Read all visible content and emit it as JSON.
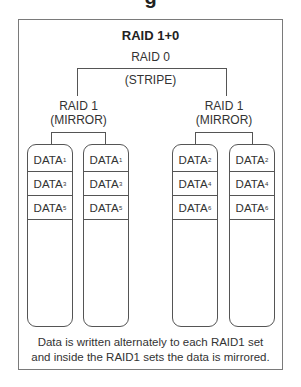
{
  "header": {
    "cut_off_title": "g"
  },
  "diagram": {
    "title": "RAID 1+0",
    "stripe": {
      "label": "RAID 0",
      "sublabel": "(STRIPE)"
    },
    "mirrors": [
      {
        "label": "RAID 1",
        "sublabel": "(MIRROR)",
        "disks": [
          {
            "blocks": [
              {
                "name": "DATA",
                "sub": "1"
              },
              {
                "name": "DATA",
                "sub": "3"
              },
              {
                "name": "DATA",
                "sub": "5"
              }
            ]
          },
          {
            "blocks": [
              {
                "name": "DATA",
                "sub": "1"
              },
              {
                "name": "DATA",
                "sub": "3"
              },
              {
                "name": "DATA",
                "sub": "5"
              }
            ]
          }
        ]
      },
      {
        "label": "RAID 1",
        "sublabel": "(MIRROR)",
        "disks": [
          {
            "blocks": [
              {
                "name": "DATA",
                "sub": "2"
              },
              {
                "name": "DATA",
                "sub": "4"
              },
              {
                "name": "DATA",
                "sub": "6"
              }
            ]
          },
          {
            "blocks": [
              {
                "name": "DATA",
                "sub": "2"
              },
              {
                "name": "DATA",
                "sub": "4"
              },
              {
                "name": "DATA",
                "sub": "6"
              }
            ]
          }
        ]
      }
    ],
    "caption_line1": "Data is written alternately to each RAID1 set",
    "caption_line2": "and inside the RAID1 sets the data is mirrored."
  },
  "colors": {
    "line": "#555555",
    "frame": "#7a7a7a",
    "text": "#333333"
  }
}
